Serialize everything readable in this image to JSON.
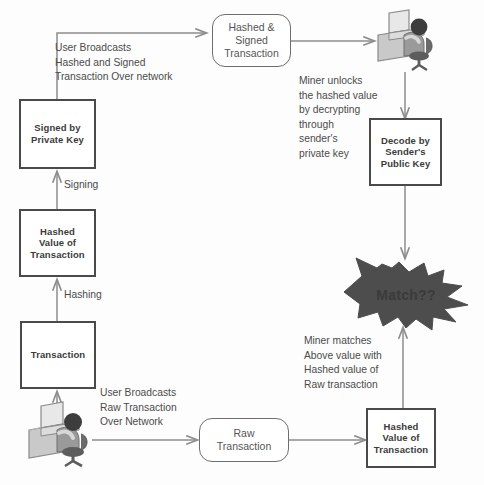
{
  "diagram": {
    "background_color": "#fdfdfd",
    "line_color": "#8c8c8c",
    "box_border_color": "#4a4a4a",
    "burst_color": "#4d4d4d",
    "text_color": "#4b4b4b"
  },
  "nodes": {
    "transaction": "Transaction",
    "hashed_value_of_transaction": "Hashed\nValue of\nTransaction",
    "signed_by_private_key": "Signed by\nPrivate Key",
    "hashed_and_signed_transaction": "Hashed &\nSigned\nTransaction",
    "decode_by_senders_public_key": "Decode by\nSender's\nPublic Key",
    "raw_transaction": "Raw\nTransaction",
    "hashed_value_of_raw_transaction": "Hashed\nValue of\nTransaction",
    "match_burst": "Match??"
  },
  "edge_labels": {
    "hashing": "Hashing",
    "signing": "Signing",
    "user_broadcasts_signed": "User Broadcasts\nHashed and Signed\nTransaction Over network",
    "user_broadcasts_raw": "User Broadcasts\nRaw Transaction\nOver Network",
    "miner_unlocks": "Miner unlocks\nthe hashed  value\nby decrypting\nthrough\nsender's\nprivate key",
    "miner_matches": "Miner matches\nAbove value with\nHashed value of\nRaw transaction"
  },
  "actors": {
    "user": "user-at-computer",
    "miner": "miner-at-computer"
  }
}
